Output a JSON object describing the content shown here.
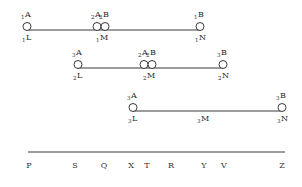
{
  "diagram": {
    "rows": [
      {
        "id": "row1",
        "line": {
          "x1": 27,
          "x2": 200,
          "y": 30
        },
        "circles": [
          {
            "x": 27,
            "label_pre": "1",
            "label": "A"
          },
          {
            "x": 97,
            "label_pre": "2",
            "label": "A"
          },
          {
            "x": 105,
            "label_pre": "2",
            "label": "B"
          },
          {
            "x": 200,
            "label_pre": "1",
            "label": "B"
          }
        ],
        "points": [
          {
            "x": 27,
            "label_pre": "1",
            "label": "L"
          },
          {
            "x": 101,
            "label_pre": "1",
            "label": "M"
          },
          {
            "x": 200,
            "label_pre": "1",
            "label": "N"
          }
        ]
      },
      {
        "id": "row2",
        "line": {
          "x1": 78,
          "x2": 223,
          "y": 68
        },
        "circles": [
          {
            "x": 78,
            "label_pre": "3",
            "label": "A"
          },
          {
            "x": 144,
            "label_pre": "2",
            "label": "A"
          },
          {
            "x": 152,
            "label_pre": "2",
            "label": "B"
          },
          {
            "x": 223,
            "label_pre": "3",
            "label": "B"
          }
        ],
        "points": [
          {
            "x": 78,
            "label_pre": "2",
            "label": "L"
          },
          {
            "x": 148,
            "label_pre": "2",
            "label": "M"
          },
          {
            "x": 223,
            "label_pre": "2",
            "label": "N"
          }
        ]
      },
      {
        "id": "row3",
        "line": {
          "x1": 133,
          "x2": 282,
          "y": 111
        },
        "circles": [
          {
            "x": 133,
            "label_pre": "3",
            "label": "A"
          },
          {
            "x": 282,
            "label_pre": "3",
            "label": "B"
          }
        ],
        "points": [
          {
            "x": 133,
            "label_pre": "3",
            "label": "L"
          },
          {
            "x": 202,
            "label_pre": "3",
            "label": "M"
          },
          {
            "x": 282,
            "label_pre": "3",
            "label": "N"
          }
        ]
      }
    ],
    "axis": {
      "line": {
        "x1": 28,
        "x2": 285,
        "y": 152
      },
      "labels": [
        {
          "x": 29,
          "text": "P"
        },
        {
          "x": 75,
          "text": "S"
        },
        {
          "x": 104,
          "text": "Q"
        },
        {
          "x": 131,
          "text": "X"
        },
        {
          "x": 147,
          "text": "T"
        },
        {
          "x": 171,
          "text": "R"
        },
        {
          "x": 204,
          "text": "Y"
        },
        {
          "x": 224,
          "text": "V"
        },
        {
          "x": 282,
          "text": "Z"
        }
      ]
    },
    "colors": {
      "line": "#3a3a3a",
      "circle": "#3a3a3a",
      "text": "#2a2a2a"
    }
  }
}
